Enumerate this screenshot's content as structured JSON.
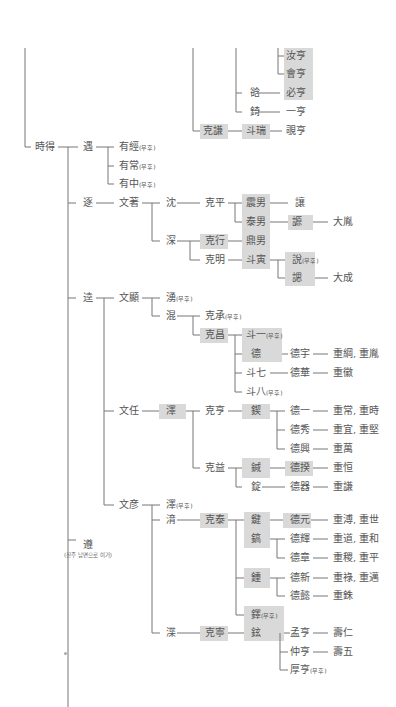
{
  "diagram": {
    "type": "genealogy-tree",
    "no_heir_marker": "무후",
    "highlight_color": "#d9d9d9",
    "line_color": "#777777",
    "nodes": [
      {
        "id": "n1",
        "label": "汝亨",
        "x": 286,
        "y": 56
      },
      {
        "id": "n2",
        "label": "會亨",
        "x": 286,
        "y": 74
      },
      {
        "id": "n3",
        "label": "谽",
        "x": 250,
        "y": 93
      },
      {
        "id": "n4",
        "label": "必亨",
        "x": 286,
        "y": 93
      },
      {
        "id": "n5",
        "label": "錡",
        "x": 250,
        "y": 112
      },
      {
        "id": "n6",
        "label": "一亨",
        "x": 286,
        "y": 112
      },
      {
        "id": "n7",
        "label": "克謙",
        "x": 203,
        "y": 131
      },
      {
        "id": "n8",
        "label": "斗瑞",
        "x": 246,
        "y": 131
      },
      {
        "id": "n9",
        "label": "覗亨",
        "x": 286,
        "y": 131
      },
      {
        "id": "n10",
        "label": "時得",
        "x": 35,
        "y": 147
      },
      {
        "id": "n11",
        "label": "遇",
        "x": 83,
        "y": 147
      },
      {
        "id": "n12",
        "label": "有經",
        "note": "무후",
        "x": 119,
        "y": 147
      },
      {
        "id": "n13",
        "label": "有常",
        "note": "무후",
        "x": 119,
        "y": 166
      },
      {
        "id": "n14",
        "label": "有中",
        "note": "무후",
        "x": 119,
        "y": 184
      },
      {
        "id": "n15",
        "label": "逐",
        "x": 83,
        "y": 203
      },
      {
        "id": "n16",
        "label": "文著",
        "x": 119,
        "y": 203
      },
      {
        "id": "n17",
        "label": "沈",
        "x": 166,
        "y": 203
      },
      {
        "id": "n18",
        "label": "克平",
        "x": 205,
        "y": 203
      },
      {
        "id": "n19",
        "label": "震男",
        "x": 246,
        "y": 203
      },
      {
        "id": "n20",
        "label": "讓",
        "x": 295,
        "y": 203
      },
      {
        "id": "n21",
        "label": "泰男",
        "x": 246,
        "y": 222
      },
      {
        "id": "n22",
        "label": "謜",
        "x": 292,
        "y": 222
      },
      {
        "id": "n23",
        "label": "大胤",
        "x": 333,
        "y": 222
      },
      {
        "id": "n24",
        "label": "深",
        "x": 166,
        "y": 241
      },
      {
        "id": "n25",
        "label": "克行",
        "x": 205,
        "y": 241
      },
      {
        "id": "n26",
        "label": "鼎男",
        "x": 246,
        "y": 241
      },
      {
        "id": "n27",
        "label": "克明",
        "x": 205,
        "y": 260
      },
      {
        "id": "n28",
        "label": "斗寅",
        "x": 246,
        "y": 260
      },
      {
        "id": "n29",
        "label": "說",
        "note": "무후",
        "x": 292,
        "y": 260
      },
      {
        "id": "n30",
        "label": "諰",
        "x": 292,
        "y": 278
      },
      {
        "id": "n31",
        "label": "大成",
        "x": 333,
        "y": 278
      },
      {
        "id": "n32",
        "label": "逵",
        "x": 83,
        "y": 298
      },
      {
        "id": "n33",
        "label": "文顯",
        "x": 119,
        "y": 298
      },
      {
        "id": "n34",
        "label": "湧",
        "note": "무후",
        "x": 166,
        "y": 298
      },
      {
        "id": "n35",
        "label": "混",
        "x": 166,
        "y": 316
      },
      {
        "id": "n36",
        "label": "克承",
        "note": "무후",
        "x": 205,
        "y": 316
      },
      {
        "id": "n37",
        "label": "克昌",
        "x": 205,
        "y": 335
      },
      {
        "id": "n38",
        "label": "斗一",
        "note": "무후",
        "x": 246,
        "y": 335
      },
      {
        "id": "n39",
        "label": "德",
        "x": 251,
        "y": 354
      },
      {
        "id": "n40",
        "label": "德宇",
        "x": 290,
        "y": 354
      },
      {
        "id": "n41",
        "label": "重綱, 重胤",
        "x": 333,
        "y": 354
      },
      {
        "id": "n42",
        "label": "斗七",
        "x": 246,
        "y": 373
      },
      {
        "id": "n43",
        "label": "德華",
        "x": 290,
        "y": 373
      },
      {
        "id": "n44",
        "label": "重徽",
        "x": 333,
        "y": 373
      },
      {
        "id": "n45",
        "label": "斗八",
        "note": "무후",
        "x": 246,
        "y": 392
      },
      {
        "id": "n46",
        "label": "文任",
        "x": 119,
        "y": 411
      },
      {
        "id": "n47",
        "label": "澤",
        "x": 166,
        "y": 411
      },
      {
        "id": "n48",
        "label": "克亨",
        "x": 205,
        "y": 411
      },
      {
        "id": "n49",
        "label": "鍥",
        "x": 251,
        "y": 411
      },
      {
        "id": "n50",
        "label": "德一",
        "x": 290,
        "y": 411
      },
      {
        "id": "n51",
        "label": "重常, 重時",
        "x": 333,
        "y": 411
      },
      {
        "id": "n52",
        "label": "德秀",
        "x": 290,
        "y": 430
      },
      {
        "id": "n53",
        "label": "重宜, 重堅",
        "x": 333,
        "y": 430
      },
      {
        "id": "n54",
        "label": "德興",
        "x": 290,
        "y": 449
      },
      {
        "id": "n55",
        "label": "重萬",
        "x": 333,
        "y": 449
      },
      {
        "id": "n56",
        "label": "克益",
        "x": 205,
        "y": 468
      },
      {
        "id": "n57",
        "label": "鍼",
        "x": 251,
        "y": 468
      },
      {
        "id": "n58",
        "label": "德揆",
        "x": 290,
        "y": 468
      },
      {
        "id": "n59",
        "label": "重恒",
        "x": 333,
        "y": 468
      },
      {
        "id": "n60",
        "label": "錠",
        "x": 251,
        "y": 487
      },
      {
        "id": "n61",
        "label": "德器",
        "x": 290,
        "y": 487
      },
      {
        "id": "n62",
        "label": "重謙",
        "x": 333,
        "y": 487
      },
      {
        "id": "n63",
        "label": "文彦",
        "x": 119,
        "y": 505
      },
      {
        "id": "n64",
        "label": "澤",
        "note": "무후",
        "x": 166,
        "y": 505
      },
      {
        "id": "n65",
        "label": "湇",
        "x": 166,
        "y": 520
      },
      {
        "id": "n66",
        "label": "克泰",
        "x": 205,
        "y": 520
      },
      {
        "id": "n67",
        "label": "鍵",
        "x": 251,
        "y": 520
      },
      {
        "id": "n68",
        "label": "德元",
        "x": 290,
        "y": 520
      },
      {
        "id": "n69",
        "label": "重溥, 重世",
        "x": 333,
        "y": 520
      },
      {
        "id": "n70",
        "label": "鎬",
        "x": 251,
        "y": 539
      },
      {
        "id": "n71",
        "label": "德輝",
        "x": 290,
        "y": 539
      },
      {
        "id": "n72",
        "label": "重道, 重和",
        "x": 333,
        "y": 539
      },
      {
        "id": "n73",
        "label": "德章",
        "x": 290,
        "y": 558
      },
      {
        "id": "n74",
        "label": "重稷, 重平",
        "x": 333,
        "y": 558
      },
      {
        "id": "n75",
        "label": "鍾",
        "x": 251,
        "y": 578
      },
      {
        "id": "n76",
        "label": "德新",
        "x": 290,
        "y": 578
      },
      {
        "id": "n77",
        "label": "重祿, 重邁",
        "x": 333,
        "y": 578
      },
      {
        "id": "n78",
        "label": "德懿",
        "x": 290,
        "y": 596
      },
      {
        "id": "n79",
        "label": "重銖",
        "x": 333,
        "y": 596
      },
      {
        "id": "n80",
        "label": "遵",
        "x": 83,
        "y": 545
      },
      {
        "id": "n81",
        "label": "鐸",
        "note": "무후",
        "x": 251,
        "y": 615
      },
      {
        "id": "n82",
        "label": "渫",
        "x": 166,
        "y": 633
      },
      {
        "id": "n83",
        "label": "克寧",
        "x": 205,
        "y": 633
      },
      {
        "id": "n84",
        "label": "鉉",
        "x": 251,
        "y": 633
      },
      {
        "id": "n85",
        "label": "孟亨",
        "x": 290,
        "y": 633
      },
      {
        "id": "n86",
        "label": "壽仁",
        "x": 333,
        "y": 633
      },
      {
        "id": "n87",
        "label": "仲亨",
        "x": 290,
        "y": 652
      },
      {
        "id": "n88",
        "label": "壽五",
        "x": 333,
        "y": 652
      },
      {
        "id": "n89",
        "label": "厚亨",
        "note": "무후",
        "x": 290,
        "y": 670
      }
    ],
    "annotations": [
      {
        "id": "a1",
        "text": "(진주 남면으로 이거)",
        "x": 64,
        "y": 555
      }
    ]
  }
}
